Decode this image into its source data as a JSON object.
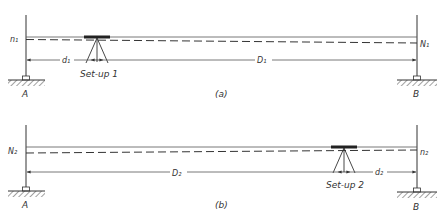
{
  "figure": {
    "panels": [
      {
        "id": "a",
        "caption": "(a)",
        "station_left": "A",
        "station_right": "B",
        "rod_reading_left": "n₁",
        "rod_reading_right": "N₁",
        "short_distance": "d₁",
        "long_distance": "D₁",
        "setup_label": "Set-up 1"
      },
      {
        "id": "b",
        "caption": "(b)",
        "station_left": "A",
        "station_right": "B",
        "rod_reading_left": "N₂",
        "rod_reading_right": "n₂",
        "long_distance": "D₂",
        "short_distance": "d₂",
        "setup_label": "Set-up 2"
      }
    ],
    "colors": {
      "line": "#333333",
      "background": "#ffffff"
    }
  }
}
